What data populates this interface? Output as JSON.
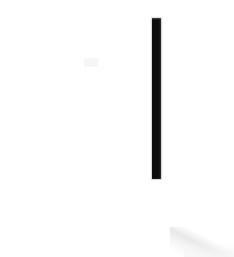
{
  "scene": {
    "title": "Cropped UI Fragment",
    "description": "Near-blank white crop containing a single tall dark vertical bar",
    "width": 234,
    "height": 257,
    "background_color": "#ffffff"
  },
  "elements": {
    "vertical_bar": {
      "name": "vertical-bar",
      "color": "#0d0d0d",
      "x": 152,
      "y": 18,
      "width": 9,
      "height": 161
    },
    "corner_shadow": {
      "name": "corner-shadow",
      "color": "#d6d6d6",
      "position": "bottom-right"
    },
    "faint_mark": {
      "name": "faint-mark",
      "color": "#f6f6f8",
      "x": 84,
      "y": 58
    }
  }
}
